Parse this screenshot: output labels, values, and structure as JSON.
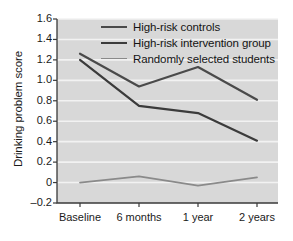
{
  "chart_data": {
    "type": "line",
    "title": "",
    "xlabel": "",
    "ylabel": "Drinking problem score",
    "categories": [
      "Baseline",
      "6 months",
      "1 year",
      "2 years"
    ],
    "ylim": [
      -0.2,
      1.6
    ],
    "yticks": [
      "1.6",
      "1.4",
      "1.2",
      "1.0",
      "0.8",
      "0.6",
      "0.4",
      "0.2",
      "0",
      "-0.2"
    ],
    "ytick_values": [
      1.6,
      1.4,
      1.2,
      1.0,
      0.8,
      0.6,
      0.4,
      0.2,
      0.0,
      -0.2
    ],
    "grid": "horizontal",
    "legend_position": "top-center",
    "series": [
      {
        "name": "High-risk controls",
        "color": "#4a4a4a",
        "values": [
          1.26,
          0.94,
          1.13,
          0.81
        ]
      },
      {
        "name": "High-risk intervention group",
        "color": "#3b3b3b",
        "values": [
          1.2,
          0.75,
          0.68,
          0.41
        ]
      },
      {
        "name": "Randomly selected students",
        "color": "#8a8a8a",
        "values": [
          0.0,
          0.06,
          -0.03,
          0.05
        ]
      }
    ]
  },
  "style": {
    "plot_background": "#d8d8d8",
    "gridline_color": "#f2f2f2",
    "axis_color": "#3a3a3a",
    "text_color": "#1a1a1a"
  }
}
